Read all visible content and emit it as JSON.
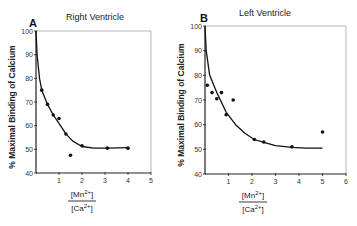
{
  "chart_data": [
    {
      "type": "scatter",
      "panel_label": "A",
      "title": "Right Ventricle",
      "xlabel_numerator": "[Mn2+]",
      "xlabel_denominator": "[Ca2+]",
      "ylabel": "% Maximal Binding of Calcium",
      "xlim": [
        0,
        5
      ],
      "ylim": [
        40,
        100
      ],
      "xticks": [
        "1",
        "2",
        "3",
        "4",
        "5"
      ],
      "yticks": [
        "40",
        "50",
        "60",
        "70",
        "80",
        "90",
        "100"
      ],
      "grid": false,
      "points": [
        {
          "x": 0.25,
          "y": 75
        },
        {
          "x": 0.5,
          "y": 69
        },
        {
          "x": 0.75,
          "y": 64.5
        },
        {
          "x": 1.0,
          "y": 63
        },
        {
          "x": 1.3,
          "y": 56.5
        },
        {
          "x": 1.5,
          "y": 47.5
        },
        {
          "x": 2.0,
          "y": 51.5
        },
        {
          "x": 3.1,
          "y": 50.5
        },
        {
          "x": 4.0,
          "y": 50.5
        }
      ],
      "fit_curve": [
        {
          "x": 0.0,
          "y": 100
        },
        {
          "x": 0.05,
          "y": 90
        },
        {
          "x": 0.15,
          "y": 80
        },
        {
          "x": 0.25,
          "y": 75
        },
        {
          "x": 0.5,
          "y": 69
        },
        {
          "x": 0.75,
          "y": 64.5
        },
        {
          "x": 1.0,
          "y": 61
        },
        {
          "x": 1.3,
          "y": 56.5
        },
        {
          "x": 1.6,
          "y": 53.5
        },
        {
          "x": 2.0,
          "y": 51.2
        },
        {
          "x": 2.5,
          "y": 50.5
        },
        {
          "x": 3.1,
          "y": 50.5
        },
        {
          "x": 4.0,
          "y": 50.7
        }
      ]
    },
    {
      "type": "scatter",
      "panel_label": "B",
      "title": "Left Ventricle",
      "xlabel_numerator": "[Mn2+]",
      "xlabel_denominator": "[Ca2+]",
      "ylabel": "% Maximal Binding of Calcium",
      "xlim": [
        0,
        6
      ],
      "ylim": [
        40,
        100
      ],
      "xticks": [
        "1",
        "2",
        "3",
        "4",
        "5",
        "6"
      ],
      "yticks": [
        "40",
        "50",
        "60",
        "70",
        "80",
        "90",
        "100"
      ],
      "grid": false,
      "points": [
        {
          "x": 0.1,
          "y": 76
        },
        {
          "x": 0.3,
          "y": 73
        },
        {
          "x": 0.5,
          "y": 70.5
        },
        {
          "x": 0.7,
          "y": 73
        },
        {
          "x": 0.9,
          "y": 64
        },
        {
          "x": 1.2,
          "y": 70
        },
        {
          "x": 2.1,
          "y": 54
        },
        {
          "x": 2.5,
          "y": 53
        },
        {
          "x": 3.7,
          "y": 51
        },
        {
          "x": 5.0,
          "y": 57
        }
      ],
      "fit_curve": [
        {
          "x": 0.0,
          "y": 100
        },
        {
          "x": 0.05,
          "y": 90
        },
        {
          "x": 0.2,
          "y": 80
        },
        {
          "x": 0.5,
          "y": 73
        },
        {
          "x": 0.9,
          "y": 65
        },
        {
          "x": 1.3,
          "y": 60
        },
        {
          "x": 1.7,
          "y": 56.5
        },
        {
          "x": 2.1,
          "y": 54
        },
        {
          "x": 2.5,
          "y": 52.8
        },
        {
          "x": 3.0,
          "y": 51.5
        },
        {
          "x": 3.7,
          "y": 50.8
        },
        {
          "x": 4.3,
          "y": 50.5
        },
        {
          "x": 5.0,
          "y": 50.5
        }
      ]
    }
  ],
  "panels": [
    {
      "label": "A",
      "title": "Right Ventricle",
      "ylabel": "% Maximal Binding of Calcium",
      "num": "Mn",
      "num_sup": "2+",
      "den": "Ca",
      "den_sup": "2+"
    },
    {
      "label": "B",
      "title": "Left Ventricle",
      "ylabel": "% Maximal Binding of Calcium",
      "num": "Mn",
      "num_sup": "2+",
      "den": "Ca",
      "den_sup": "2+"
    }
  ]
}
